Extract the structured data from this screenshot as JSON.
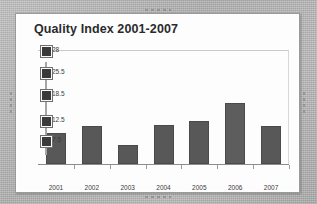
{
  "chart": {
    "title": "Quality Index 2001-2007",
    "bar_color": "#585858",
    "panel_color": "#fdfdfd",
    "backdrop_color": "#b8b8b8"
  },
  "chart_data": {
    "type": "bar",
    "title": "Quality Index 2001-2007",
    "xlabel": "",
    "ylabel": "",
    "categories": [
      "2001",
      "2002",
      "2003",
      "2004",
      "2005",
      "2006",
      "2007"
    ],
    "values": [
      8.0,
      10.2,
      5.0,
      10.5,
      11.8,
      16.5,
      10.2
    ],
    "series": [
      {
        "name": "Quality Index",
        "values": [
          8.0,
          10.2,
          5.0,
          10.5,
          11.8,
          16.5,
          10.2
        ]
      }
    ],
    "ytick_labels": [
      "28",
      "25.5",
      "18.5",
      "12.5",
      "7.5"
    ],
    "ytick_pixel_fraction": [
      0.0,
      0.19,
      0.38,
      0.61,
      0.78
    ],
    "ylim": [
      0,
      28
    ],
    "grid": false,
    "legend": null,
    "bar_pixel_heights": [
      31,
      38,
      19,
      39,
      43,
      61,
      38
    ]
  },
  "selection": {
    "handle_count": 5,
    "axis": "y-axis"
  }
}
